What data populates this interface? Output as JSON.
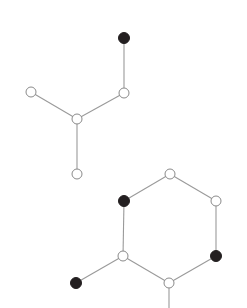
{
  "diagram": {
    "type": "molecular-graph",
    "width": 247,
    "height": 308,
    "colors": {
      "background": "#ffffff",
      "edge": "#9a9a9a",
      "node_open_fill": "#ffffff",
      "node_open_stroke": "#8a8a8a",
      "node_filled": "#231f20"
    },
    "node_radius": 5,
    "molecules": [
      {
        "id": "branched",
        "nodes": [
          {
            "id": "a1",
            "x": 124,
            "y": 38,
            "filled": true
          },
          {
            "id": "a2",
            "x": 124,
            "y": 93,
            "filled": false
          },
          {
            "id": "a3",
            "x": 31,
            "y": 92,
            "filled": false
          },
          {
            "id": "a4",
            "x": 77,
            "y": 119,
            "filled": false
          },
          {
            "id": "a5",
            "x": 77,
            "y": 174,
            "filled": false
          }
        ],
        "edges": [
          [
            "a1",
            "a2"
          ],
          [
            "a2",
            "a4"
          ],
          [
            "a3",
            "a4"
          ],
          [
            "a4",
            "a5"
          ]
        ]
      },
      {
        "id": "ring",
        "nodes": [
          {
            "id": "b1",
            "x": 170,
            "y": 174,
            "filled": false
          },
          {
            "id": "b2",
            "x": 124,
            "y": 201,
            "filled": true
          },
          {
            "id": "b3",
            "x": 216,
            "y": 201,
            "filled": false
          },
          {
            "id": "b4",
            "x": 123,
            "y": 256,
            "filled": false
          },
          {
            "id": "b5",
            "x": 216,
            "y": 256,
            "filled": true
          },
          {
            "id": "b6",
            "x": 169,
            "y": 283,
            "filled": false
          },
          {
            "id": "b7",
            "x": 76,
            "y": 283,
            "filled": true
          }
        ],
        "edges": [
          [
            "b1",
            "b2"
          ],
          [
            "b1",
            "b3"
          ],
          [
            "b2",
            "b4"
          ],
          [
            "b3",
            "b5"
          ],
          [
            "b4",
            "b6"
          ],
          [
            "b5",
            "b6"
          ],
          [
            "b4",
            "b7"
          ]
        ],
        "stubs": [
          {
            "from": "b6",
            "x2": 169,
            "y2": 308
          }
        ]
      }
    ]
  }
}
